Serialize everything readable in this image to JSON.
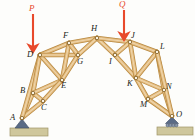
{
  "figure": {
    "background_color": "#fdfdfb",
    "member_color": "#e3bb81",
    "member_edge_color": "#b8893f",
    "joint_pin_color": "#fbf3e2",
    "joint_pin_edge": "#8a6a33",
    "load_color": "#e8492b",
    "support_color": "#5a6b86",
    "ground_color": "#cfc79c",
    "ground_edge_color": "#9e9468"
  },
  "loads": [
    {
      "name": "P",
      "label": "P",
      "at_joint": "D",
      "direction": "down",
      "x": 33,
      "y_top": 14,
      "y_tip": 52,
      "label_x": 29,
      "label_y": 4
    },
    {
      "name": "Q",
      "label": "Q",
      "at_joint": "J",
      "direction": "down",
      "x": 124,
      "y_top": 10,
      "y_tip": 40,
      "label_x": 119,
      "label_y": 0
    }
  ],
  "joints": [
    {
      "id": "A",
      "label": "A",
      "x": 22,
      "y": 118,
      "label_x": 10,
      "label_y": 113,
      "support": "pin"
    },
    {
      "id": "B",
      "label": "B",
      "x": 33,
      "y": 93,
      "label_x": 20,
      "label_y": 86,
      "support": "none"
    },
    {
      "id": "C",
      "label": "C",
      "x": 43,
      "y": 101,
      "label_x": 41,
      "label_y": 103,
      "support": "none"
    },
    {
      "id": "D",
      "label": "D",
      "x": 40,
      "y": 55,
      "label_x": 27,
      "label_y": 50,
      "support": "none"
    },
    {
      "id": "E",
      "label": "E",
      "x": 62,
      "y": 80,
      "label_x": 61,
      "label_y": 81,
      "support": "none"
    },
    {
      "id": "F",
      "label": "F",
      "x": 69,
      "y": 43,
      "label_x": 63,
      "label_y": 31,
      "support": "none"
    },
    {
      "id": "G",
      "label": "G",
      "x": 78,
      "y": 55,
      "label_x": 77,
      "label_y": 57,
      "support": "none"
    },
    {
      "id": "H",
      "label": "H",
      "x": 97,
      "y": 38,
      "label_x": 91,
      "label_y": 24,
      "support": "none"
    },
    {
      "id": "I",
      "label": "I",
      "x": 115,
      "y": 55,
      "label_x": 109,
      "label_y": 57,
      "support": "none"
    },
    {
      "id": "J",
      "label": "J",
      "x": 130,
      "y": 42,
      "label_x": 131,
      "label_y": 31,
      "support": "none"
    },
    {
      "id": "K",
      "label": "K",
      "x": 136,
      "y": 78,
      "label_x": 127,
      "label_y": 79,
      "support": "none"
    },
    {
      "id": "L",
      "label": "L",
      "x": 157,
      "y": 52,
      "label_x": 160,
      "label_y": 42,
      "support": "none"
    },
    {
      "id": "M",
      "label": "M",
      "x": 148,
      "y": 99,
      "label_x": 140,
      "label_y": 100,
      "support": "none"
    },
    {
      "id": "N",
      "label": "N",
      "x": 164,
      "y": 90,
      "label_x": 166,
      "label_y": 82,
      "support": "none"
    },
    {
      "id": "O",
      "label": "O",
      "x": 172,
      "y": 116,
      "label_x": 176,
      "label_y": 110,
      "support": "roller"
    }
  ],
  "members": [
    {
      "from": "A",
      "to": "B"
    },
    {
      "from": "A",
      "to": "C"
    },
    {
      "from": "A",
      "to": "D"
    },
    {
      "from": "B",
      "to": "C"
    },
    {
      "from": "B",
      "to": "D"
    },
    {
      "from": "B",
      "to": "E"
    },
    {
      "from": "C",
      "to": "E"
    },
    {
      "from": "D",
      "to": "E"
    },
    {
      "from": "D",
      "to": "F"
    },
    {
      "from": "D",
      "to": "G"
    },
    {
      "from": "E",
      "to": "F"
    },
    {
      "from": "E",
      "to": "G"
    },
    {
      "from": "F",
      "to": "G"
    },
    {
      "from": "F",
      "to": "H"
    },
    {
      "from": "G",
      "to": "H"
    },
    {
      "from": "H",
      "to": "I"
    },
    {
      "from": "H",
      "to": "J"
    },
    {
      "from": "I",
      "to": "J"
    },
    {
      "from": "I",
      "to": "K"
    },
    {
      "from": "J",
      "to": "K"
    },
    {
      "from": "J",
      "to": "L"
    },
    {
      "from": "K",
      "to": "L"
    },
    {
      "from": "K",
      "to": "M"
    },
    {
      "from": "K",
      "to": "N"
    },
    {
      "from": "L",
      "to": "N"
    },
    {
      "from": "M",
      "to": "N"
    },
    {
      "from": "M",
      "to": "O"
    },
    {
      "from": "N",
      "to": "O"
    },
    {
      "from": "L",
      "to": "O"
    }
  ],
  "supports": {
    "pin": {
      "joint": "A",
      "type_label": "pin",
      "base_x": 10,
      "base_y": 128,
      "base_w": 38,
      "base_h": 8
    },
    "roller": {
      "joint": "O",
      "type_label": "roller",
      "base_x": 157,
      "base_y": 127,
      "base_w": 36,
      "base_h": 8
    }
  }
}
